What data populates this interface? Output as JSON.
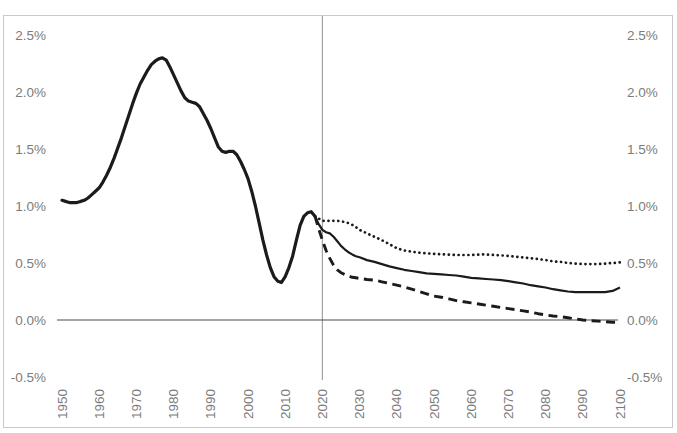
{
  "colors": {
    "series_line": "#1b1b1b",
    "axis_line": "#4a4a4a",
    "reference_line": "#a3a3a3",
    "chart_border": "#c9c9c9",
    "tick_text": "#7c7c7c",
    "background": "#ffffff"
  },
  "chart_data": {
    "type": "line",
    "title": "",
    "grid": "off",
    "legend": "none",
    "xlim": [
      1949,
      2101
    ],
    "ylim": [
      -0.5,
      2.5
    ],
    "x_axis": {
      "ticks": [
        "1950",
        "1960",
        "1970",
        "1980",
        "1990",
        "2000",
        "2010",
        "2020",
        "2030",
        "2040",
        "2050",
        "2060",
        "2070",
        "2080",
        "2090",
        "2100"
      ],
      "tick_years": [
        1950,
        1960,
        1970,
        1980,
        1990,
        2000,
        2010,
        2020,
        2030,
        2040,
        2050,
        2060,
        2070,
        2080,
        2090,
        2100
      ],
      "label_rotation_deg": -90
    },
    "y_axis": {
      "sides": [
        "left",
        "right"
      ],
      "ticks": [
        "2.5%",
        "2.0%",
        "1.5%",
        "1.0%",
        "0.5%",
        "0.0%",
        "-0.5%"
      ],
      "tick_values": [
        2.5,
        2.0,
        1.5,
        1.0,
        0.5,
        0.0,
        -0.5
      ],
      "unit": "percent"
    },
    "reference_line": {
      "orientation": "vertical",
      "x": 2020
    },
    "zero_line_y": 0.0,
    "series": [
      {
        "name": "estimates-1950-2018",
        "style": "solid-thick",
        "points": [
          [
            1950,
            1.05
          ],
          [
            1951,
            1.04
          ],
          [
            1952,
            1.03
          ],
          [
            1953,
            1.03
          ],
          [
            1954,
            1.03
          ],
          [
            1955,
            1.04
          ],
          [
            1956,
            1.05
          ],
          [
            1957,
            1.07
          ],
          [
            1958,
            1.1
          ],
          [
            1959,
            1.13
          ],
          [
            1960,
            1.16
          ],
          [
            1961,
            1.21
          ],
          [
            1962,
            1.27
          ],
          [
            1963,
            1.34
          ],
          [
            1964,
            1.42
          ],
          [
            1965,
            1.51
          ],
          [
            1966,
            1.6
          ],
          [
            1967,
            1.7
          ],
          [
            1968,
            1.8
          ],
          [
            1969,
            1.9
          ],
          [
            1970,
            1.99
          ],
          [
            1971,
            2.07
          ],
          [
            1972,
            2.13
          ],
          [
            1973,
            2.19
          ],
          [
            1974,
            2.24
          ],
          [
            1975,
            2.27
          ],
          [
            1976,
            2.29
          ],
          [
            1977,
            2.3
          ],
          [
            1978,
            2.28
          ],
          [
            1979,
            2.22
          ],
          [
            1980,
            2.15
          ],
          [
            1981,
            2.08
          ],
          [
            1982,
            2.01
          ],
          [
            1983,
            1.95
          ],
          [
            1984,
            1.92
          ],
          [
            1985,
            1.91
          ],
          [
            1986,
            1.9
          ],
          [
            1987,
            1.87
          ],
          [
            1988,
            1.81
          ],
          [
            1989,
            1.75
          ],
          [
            1990,
            1.68
          ],
          [
            1991,
            1.6
          ],
          [
            1992,
            1.52
          ],
          [
            1993,
            1.48
          ],
          [
            1994,
            1.47
          ],
          [
            1995,
            1.48
          ],
          [
            1996,
            1.48
          ],
          [
            1997,
            1.45
          ],
          [
            1998,
            1.39
          ],
          [
            1999,
            1.32
          ],
          [
            2000,
            1.24
          ],
          [
            2001,
            1.13
          ],
          [
            2002,
            1.0
          ],
          [
            2003,
            0.85
          ],
          [
            2004,
            0.7
          ],
          [
            2005,
            0.57
          ],
          [
            2006,
            0.46
          ],
          [
            2007,
            0.38
          ],
          [
            2008,
            0.34
          ],
          [
            2009,
            0.33
          ],
          [
            2010,
            0.38
          ],
          [
            2011,
            0.46
          ],
          [
            2012,
            0.56
          ],
          [
            2013,
            0.7
          ],
          [
            2014,
            0.83
          ],
          [
            2015,
            0.91
          ],
          [
            2016,
            0.94
          ],
          [
            2017,
            0.95
          ],
          [
            2018,
            0.91
          ]
        ]
      },
      {
        "name": "projection-high-variant",
        "style": "dotted",
        "points": [
          [
            2018,
            0.91
          ],
          [
            2019,
            0.89
          ],
          [
            2020,
            0.87
          ],
          [
            2021,
            0.87
          ],
          [
            2022,
            0.87
          ],
          [
            2023,
            0.87
          ],
          [
            2024,
            0.87
          ],
          [
            2025,
            0.865
          ],
          [
            2026,
            0.86
          ],
          [
            2027,
            0.85
          ],
          [
            2028,
            0.835
          ],
          [
            2029,
            0.815
          ],
          [
            2030,
            0.79
          ],
          [
            2031,
            0.775
          ],
          [
            2032,
            0.76
          ],
          [
            2034,
            0.73
          ],
          [
            2036,
            0.7
          ],
          [
            2038,
            0.665
          ],
          [
            2040,
            0.63
          ],
          [
            2042,
            0.61
          ],
          [
            2044,
            0.6
          ],
          [
            2046,
            0.59
          ],
          [
            2048,
            0.585
          ],
          [
            2050,
            0.58
          ],
          [
            2053,
            0.575
          ],
          [
            2056,
            0.57
          ],
          [
            2060,
            0.57
          ],
          [
            2063,
            0.575
          ],
          [
            2066,
            0.57
          ],
          [
            2069,
            0.565
          ],
          [
            2072,
            0.555
          ],
          [
            2075,
            0.545
          ],
          [
            2078,
            0.535
          ],
          [
            2080,
            0.525
          ],
          [
            2082,
            0.515
          ],
          [
            2084,
            0.51
          ],
          [
            2086,
            0.5
          ],
          [
            2088,
            0.495
          ],
          [
            2090,
            0.49
          ],
          [
            2092,
            0.49
          ],
          [
            2094,
            0.49
          ],
          [
            2096,
            0.495
          ],
          [
            2098,
            0.5
          ],
          [
            2100,
            0.505
          ]
        ]
      },
      {
        "name": "projection-medium-variant",
        "style": "solid",
        "points": [
          [
            2018,
            0.91
          ],
          [
            2019,
            0.84
          ],
          [
            2020,
            0.79
          ],
          [
            2021,
            0.77
          ],
          [
            2022,
            0.76
          ],
          [
            2023,
            0.73
          ],
          [
            2024,
            0.69
          ],
          [
            2025,
            0.65
          ],
          [
            2026,
            0.62
          ],
          [
            2027,
            0.595
          ],
          [
            2028,
            0.575
          ],
          [
            2029,
            0.56
          ],
          [
            2030,
            0.55
          ],
          [
            2032,
            0.525
          ],
          [
            2034,
            0.51
          ],
          [
            2036,
            0.49
          ],
          [
            2038,
            0.47
          ],
          [
            2040,
            0.455
          ],
          [
            2042,
            0.44
          ],
          [
            2044,
            0.43
          ],
          [
            2046,
            0.42
          ],
          [
            2048,
            0.41
          ],
          [
            2050,
            0.405
          ],
          [
            2052,
            0.4
          ],
          [
            2054,
            0.395
          ],
          [
            2056,
            0.39
          ],
          [
            2058,
            0.38
          ],
          [
            2060,
            0.37
          ],
          [
            2062,
            0.365
          ],
          [
            2064,
            0.36
          ],
          [
            2066,
            0.355
          ],
          [
            2068,
            0.35
          ],
          [
            2070,
            0.34
          ],
          [
            2072,
            0.33
          ],
          [
            2074,
            0.32
          ],
          [
            2076,
            0.305
          ],
          [
            2078,
            0.295
          ],
          [
            2080,
            0.285
          ],
          [
            2082,
            0.27
          ],
          [
            2084,
            0.26
          ],
          [
            2086,
            0.25
          ],
          [
            2088,
            0.245
          ],
          [
            2090,
            0.245
          ],
          [
            2092,
            0.245
          ],
          [
            2094,
            0.245
          ],
          [
            2096,
            0.245
          ],
          [
            2098,
            0.255
          ],
          [
            2100,
            0.285
          ]
        ]
      },
      {
        "name": "projection-low-variant",
        "style": "dashed",
        "points": [
          [
            2018,
            0.91
          ],
          [
            2019,
            0.8
          ],
          [
            2020,
            0.7
          ],
          [
            2021,
            0.61
          ],
          [
            2022,
            0.54
          ],
          [
            2023,
            0.48
          ],
          [
            2024,
            0.44
          ],
          [
            2025,
            0.415
          ],
          [
            2026,
            0.4
          ],
          [
            2027,
            0.385
          ],
          [
            2028,
            0.375
          ],
          [
            2029,
            0.37
          ],
          [
            2030,
            0.365
          ],
          [
            2032,
            0.355
          ],
          [
            2034,
            0.35
          ],
          [
            2036,
            0.335
          ],
          [
            2038,
            0.32
          ],
          [
            2040,
            0.305
          ],
          [
            2042,
            0.29
          ],
          [
            2044,
            0.27
          ],
          [
            2046,
            0.25
          ],
          [
            2048,
            0.23
          ],
          [
            2050,
            0.21
          ],
          [
            2052,
            0.2
          ],
          [
            2054,
            0.185
          ],
          [
            2056,
            0.17
          ],
          [
            2058,
            0.16
          ],
          [
            2060,
            0.15
          ],
          [
            2062,
            0.14
          ],
          [
            2064,
            0.13
          ],
          [
            2066,
            0.12
          ],
          [
            2068,
            0.11
          ],
          [
            2070,
            0.1
          ],
          [
            2072,
            0.09
          ],
          [
            2074,
            0.08
          ],
          [
            2076,
            0.07
          ],
          [
            2078,
            0.055
          ],
          [
            2080,
            0.045
          ],
          [
            2082,
            0.035
          ],
          [
            2084,
            0.03
          ],
          [
            2086,
            0.02
          ],
          [
            2088,
            0.01
          ],
          [
            2090,
            0.0
          ],
          [
            2092,
            -0.005
          ],
          [
            2094,
            -0.01
          ],
          [
            2096,
            -0.015
          ],
          [
            2098,
            -0.02
          ],
          [
            2100,
            -0.02
          ]
        ]
      }
    ]
  }
}
